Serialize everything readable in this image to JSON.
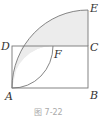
{
  "figure": {
    "caption": "图 7-22",
    "points": {
      "A": {
        "label": "A",
        "x": 12,
        "y": 88
      },
      "B": {
        "label": "B",
        "x": 88,
        "y": 88
      },
      "C": {
        "label": "C",
        "x": 88,
        "y": 46
      },
      "D": {
        "label": "D",
        "x": 12,
        "y": 46
      },
      "E": {
        "label": "E",
        "x": 88,
        "y": 10
      },
      "F": {
        "label": "F",
        "x": 53,
        "y": 46
      }
    },
    "colors": {
      "line": "#777777",
      "shade": "#ececec"
    }
  }
}
